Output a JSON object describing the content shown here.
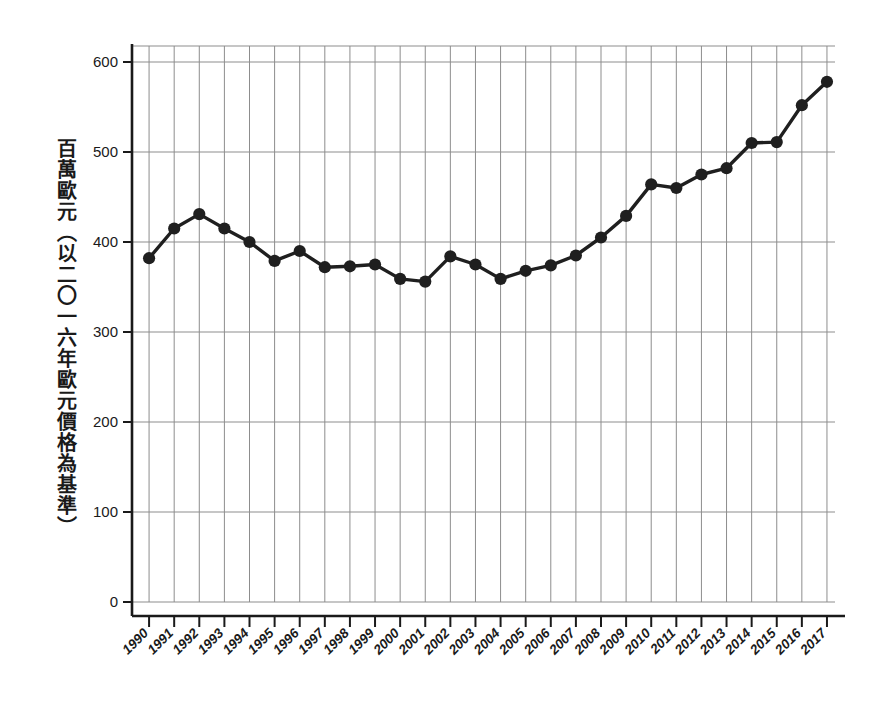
{
  "figure": {
    "background_color": "#ffffff",
    "ink_color": "#1f1f1f",
    "grid_color": "#8d8d8d"
  },
  "axis": {
    "y_axis_label": "百萬歐元（以二〇一六年歐元價格為基準）",
    "y_ticks": [
      "0",
      "100",
      "200",
      "300",
      "400",
      "500",
      "600"
    ],
    "x_ticks": [
      "1990",
      "1991",
      "1992",
      "1993",
      "1994",
      "1995",
      "1996",
      "1997",
      "1998",
      "1999",
      "2000",
      "2001",
      "2002",
      "2003",
      "2004",
      "2005",
      "2006",
      "2007",
      "2008",
      "2009",
      "2010",
      "2011",
      "2012",
      "2013",
      "2014",
      "2015",
      "2016",
      "2017"
    ]
  },
  "chart_data": {
    "type": "line",
    "title": "",
    "xlabel": "",
    "ylabel": "百萬歐元（以二〇一六年歐元價格為基準）",
    "ylim": [
      0,
      620
    ],
    "ytick_values": [
      0,
      100,
      200,
      300,
      400,
      500,
      600
    ],
    "grid": true,
    "legend": "none",
    "marker": "circle",
    "categories": [
      "1990",
      "1991",
      "1992",
      "1993",
      "1994",
      "1995",
      "1996",
      "1997",
      "1998",
      "1999",
      "2000",
      "2001",
      "2002",
      "2003",
      "2004",
      "2005",
      "2006",
      "2007",
      "2008",
      "2009",
      "2010",
      "2011",
      "2012",
      "2013",
      "2014",
      "2015",
      "2016",
      "2017"
    ],
    "values": [
      382,
      415,
      431,
      415,
      400,
      379,
      390,
      372,
      373,
      375,
      359,
      356,
      384,
      375,
      359,
      368,
      374,
      385,
      405,
      429,
      464,
      460,
      475,
      482,
      510,
      511,
      552,
      578
    ]
  }
}
